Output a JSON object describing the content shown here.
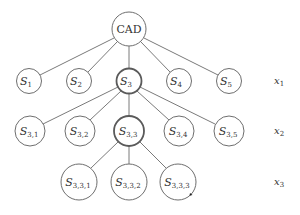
{
  "diagram": {
    "type": "tree",
    "root": {
      "label": "CAD"
    },
    "levels": [
      {
        "label_main": "x",
        "label_sub": "1",
        "nodes": [
          {
            "main": "S",
            "sub": "1"
          },
          {
            "main": "S",
            "sub": "2"
          },
          {
            "main": "S",
            "sub": "3",
            "highlighted": true
          },
          {
            "main": "S",
            "sub": "4"
          },
          {
            "main": "S",
            "sub": "5"
          }
        ]
      },
      {
        "label_main": "x",
        "label_sub": "2",
        "nodes": [
          {
            "main": "S",
            "sub": "3,1"
          },
          {
            "main": "S",
            "sub": "3,2"
          },
          {
            "main": "S",
            "sub": "3,3",
            "highlighted": true
          },
          {
            "main": "S",
            "sub": "3,4"
          },
          {
            "main": "S",
            "sub": "3,5"
          }
        ]
      },
      {
        "label_main": "x",
        "label_sub": "3",
        "nodes": [
          {
            "main": "S",
            "sub": "3,3,1"
          },
          {
            "main": "S",
            "sub": "3,3,2"
          },
          {
            "main": "S",
            "sub": "3,3,3"
          }
        ]
      }
    ],
    "edges": [
      [
        "CAD",
        "S_1"
      ],
      [
        "CAD",
        "S_2"
      ],
      [
        "CAD",
        "S_3"
      ],
      [
        "CAD",
        "S_4"
      ],
      [
        "CAD",
        "S_5"
      ],
      [
        "S_3",
        "S_3,1"
      ],
      [
        "S_3",
        "S_3,2"
      ],
      [
        "S_3",
        "S_3,3"
      ],
      [
        "S_3",
        "S_3,4"
      ],
      [
        "S_3",
        "S_3,5"
      ],
      [
        "S_3,3",
        "S_3,3,1"
      ],
      [
        "S_3,3",
        "S_3,3,2"
      ],
      [
        "S_3,3",
        "S_3,3,3"
      ]
    ]
  }
}
